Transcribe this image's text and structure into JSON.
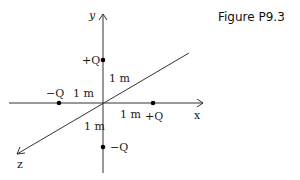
{
  "caption": "Figure P9.3",
  "axes": {
    "x_label": "x",
    "y_label": "y",
    "z_label": "z"
  },
  "charges": [
    {
      "label": "+Q",
      "axis": "y",
      "position_m": 1
    },
    {
      "label": "−Q",
      "axis": "x",
      "position_m": -1
    },
    {
      "label": "+Q",
      "axis": "x",
      "position_m": 1
    },
    {
      "label": "−Q",
      "axis": "y",
      "position_m": -1
    }
  ],
  "distance_labels": {
    "y_pos": "1 m",
    "x_neg": "1 m",
    "x_pos": "1 m",
    "y_neg": "1 m"
  },
  "colors": {
    "line": "#333333",
    "dot": "#000000"
  }
}
